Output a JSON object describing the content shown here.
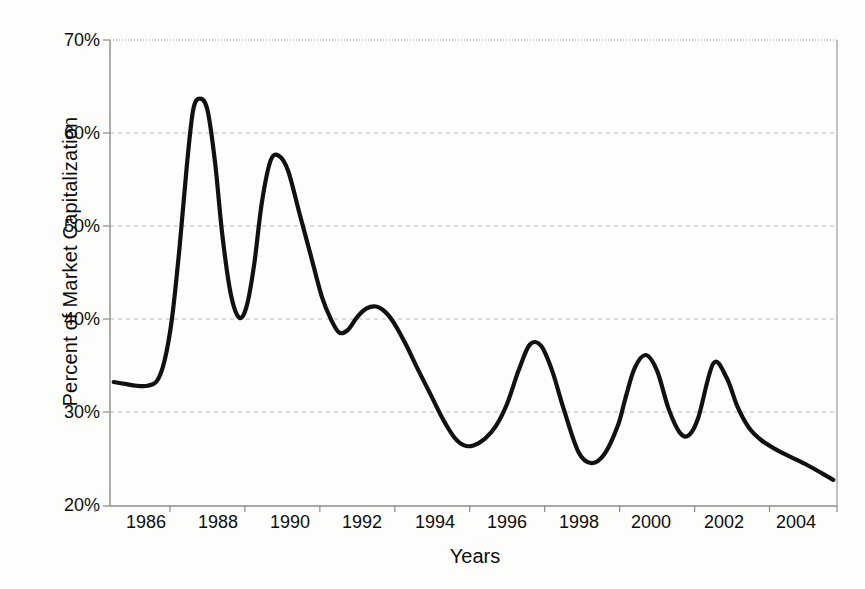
{
  "chart_data": {
    "type": "line",
    "title": "",
    "xlabel": "Years",
    "ylabel": "Percent of Market Capitalization",
    "xlim": [
      1985.4,
      2004.8
    ],
    "ylim": [
      20,
      70
    ],
    "grid": true,
    "legend": "none",
    "x_tick_labels": [
      "1986",
      "1988",
      "1990",
      "1992",
      "1994",
      "1996",
      "1998",
      "2000",
      "2002",
      "2004"
    ],
    "x_tick_values": [
      1986,
      1988,
      1990,
      1992,
      1994,
      1996,
      1998,
      2000,
      2002,
      2004
    ],
    "y_tick_labels": [
      "20%",
      "30%",
      "40%",
      "50%",
      "60%",
      "70%"
    ],
    "y_tick_values": [
      20,
      30,
      40,
      50,
      60,
      70
    ],
    "series": [
      {
        "name": "Percent of Market Capitalization",
        "color": "#111111",
        "x": [
          1985.5,
          1985.8,
          1986.1,
          1986.4,
          1986.65,
          1986.85,
          1987.05,
          1987.25,
          1987.45,
          1987.62,
          1987.8,
          1988.0,
          1988.2,
          1988.4,
          1988.62,
          1988.85,
          1989.05,
          1989.25,
          1989.45,
          1989.68,
          1989.9,
          1990.15,
          1990.45,
          1990.75,
          1991.05,
          1991.3,
          1991.52,
          1991.75,
          1992.0,
          1992.25,
          1992.5,
          1992.75,
          1993.0,
          1993.3,
          1993.6,
          1993.95,
          1994.3,
          1994.6,
          1994.85,
          1995.1,
          1995.4,
          1995.7,
          1996.0,
          1996.3,
          1996.6,
          1996.9,
          1997.2,
          1997.5,
          1997.9,
          1998.25,
          1998.6,
          1998.95,
          1999.15,
          1999.4,
          1999.7,
          2000.0,
          2000.3,
          2000.6,
          2000.85,
          2001.1,
          2001.5,
          2001.85,
          2002.15,
          2002.45,
          2002.8,
          2003.2,
          2003.6,
          2004.0,
          2004.4,
          2004.7
        ],
        "y": [
          33.3,
          33.1,
          32.9,
          32.9,
          33.4,
          35.5,
          40.0,
          47.5,
          56.5,
          62.5,
          63.7,
          62.5,
          57.0,
          49.0,
          42.8,
          40.2,
          41.5,
          46.0,
          52.5,
          57.0,
          57.6,
          56.0,
          51.5,
          47.0,
          42.5,
          40.0,
          38.6,
          38.9,
          40.3,
          41.2,
          41.4,
          40.8,
          39.5,
          37.3,
          34.8,
          32.0,
          29.2,
          27.3,
          26.5,
          26.5,
          27.2,
          28.6,
          31.0,
          34.5,
          37.3,
          37.2,
          34.5,
          30.5,
          25.8,
          24.6,
          25.6,
          28.6,
          31.5,
          34.8,
          36.2,
          34.5,
          30.5,
          27.9,
          27.6,
          29.5,
          35.3,
          33.8,
          30.6,
          28.4,
          27.0,
          26.0,
          25.2,
          24.4,
          23.5,
          22.8
        ]
      }
    ]
  },
  "axes": {
    "x_title": "Years",
    "y_title": "Percent of Market Capitalization"
  }
}
